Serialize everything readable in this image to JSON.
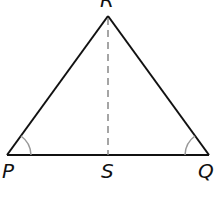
{
  "diagram": {
    "type": "triangle",
    "vertices": {
      "R": {
        "label": "R",
        "x": 108,
        "y": 16
      },
      "P": {
        "label": "P",
        "x": 7,
        "y": 155
      },
      "Q": {
        "label": "Q",
        "x": 209,
        "y": 155
      }
    },
    "points": {
      "S": {
        "label": "S",
        "x": 108,
        "y": 155
      }
    },
    "segments": [
      {
        "from": "P",
        "to": "R",
        "style": "solid"
      },
      {
        "from": "R",
        "to": "Q",
        "style": "solid"
      },
      {
        "from": "P",
        "to": "Q",
        "style": "solid"
      },
      {
        "from": "R",
        "to": "S",
        "style": "dashed"
      }
    ],
    "angle_marks": [
      {
        "vertex": "P",
        "arcs": 1
      },
      {
        "vertex": "Q",
        "arcs": 1
      }
    ],
    "colors": {
      "line": "#111111",
      "dashed": "#888888",
      "arc": "#999999"
    }
  }
}
